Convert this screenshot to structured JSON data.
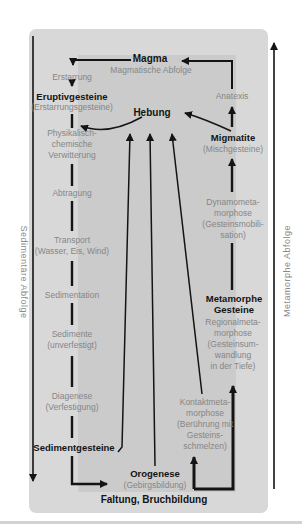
{
  "side_labels": {
    "left": "Sedimentäre Abfolge",
    "right": "Metamorphe Abfolge"
  },
  "diagram": {
    "magma": "Magma",
    "magmatische_abfolge": "Magmatische Abfolge",
    "erstarrung": "Erstarrung",
    "eruptivgesteine": "Eruptivgesteine",
    "erstarrungsgesteine": "(Erstarrungsgesteine)",
    "hebung": "Hebung",
    "anatexis": "Anatexis",
    "migmatite": "Migmatite",
    "mischgesteine": "(Mischgesteine)",
    "verwitterung": [
      "Physikalisch-",
      "chemische",
      "Verwitterung"
    ],
    "abtragung": "Abtragung",
    "dynamometamorphose": [
      "Dynamometa-",
      "morphose",
      "(Gesteinsmobili-",
      "sation)"
    ],
    "transport": [
      "Transport",
      "(Wasser, Eis, Wind)"
    ],
    "sedimentation": "Sedimentation",
    "metamorphe_gesteine": [
      "Metamorphe",
      "Gesteine"
    ],
    "sedimente": [
      "Sedimente",
      "(unverfestigt)"
    ],
    "regionalmetamorphose": [
      "Regionalmeta-",
      "morphose",
      "(Gesteinsum-",
      "wandlung",
      "in der Tiefe)"
    ],
    "diagenese": [
      "Diagenese",
      "(Verfestigung)"
    ],
    "kontaktmetamorphose": [
      "Kontaktmeta-",
      "morphose",
      "(Berührung mit",
      "Gesteins-",
      "schmelzen)"
    ],
    "sedimentgesteine": "Sedimentgesteine",
    "orogenese": "Orogenese",
    "gebirgsbildung": "(Gebirgsbildung)",
    "faltung_bruchbildung": "Faltung, Bruchbildung"
  },
  "colors": {
    "background": "#ffffff",
    "panel": "#d8d8d8",
    "inner_panel": "#cbcbcb",
    "text_gray": "#868686",
    "text_black": "#141414",
    "line": "#141414"
  }
}
